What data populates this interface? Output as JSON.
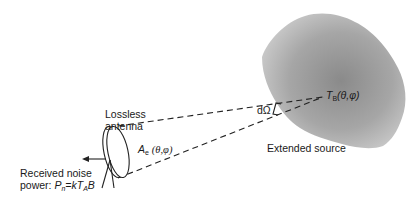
{
  "diagram": {
    "labels": {
      "antenna": [
        "Lossless",
        "antenna"
      ],
      "effective_area_symbol": "A",
      "effective_area_sub": "e",
      "effective_area_args": "(θ,φ)",
      "solid_angle": "dΩ",
      "brightness_symbol": "T",
      "brightness_sub": "B",
      "brightness_args": "(θ,φ)",
      "source": "Extended source",
      "noise_line1": "Received noise",
      "noise_line2_prefix": "power: ",
      "noise_P": "P",
      "noise_P_sub": "n",
      "noise_eq": "=k",
      "noise_T": "T",
      "noise_T_sub": "A",
      "noise_B": "B"
    },
    "colors": {
      "source_fill_center": "#8c8c8c",
      "source_fill_edge": "#c8c8c8",
      "stroke": "#222222"
    }
  }
}
